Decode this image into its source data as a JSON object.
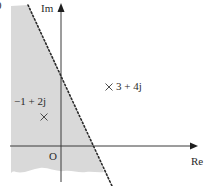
{
  "diagram": {
    "type": "argand-diagram",
    "axes": {
      "real_label": "Re",
      "imag_label": "Im",
      "origin_label": "O"
    },
    "points": [
      {
        "label": "−1 + 2j",
        "marker": "×"
      },
      {
        "label": "3 + 4j",
        "marker": "×"
      }
    ],
    "boundary": {
      "style": "dotted",
      "description": "perpendicular bisector of segment joining −1 + 2j and 3 + 4j"
    },
    "shaded_region": {
      "side": "left of dotted boundary (closer to −1 + 2j)",
      "color": "#d9d9d9"
    },
    "cropped_fragment": "0",
    "colors": {
      "axis": "#3a3a3a",
      "boundary": "#2a2a2a",
      "shading": "#d9d9d9",
      "text": "#2a2a2a"
    }
  }
}
